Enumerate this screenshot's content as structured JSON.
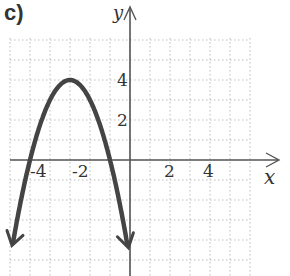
{
  "panel_label": "c)",
  "chart_data": {
    "type": "line",
    "title": "",
    "xlabel": "x",
    "ylabel": "y",
    "function": "y = -(x + 3)^2 + 4",
    "vertex": [
      -3,
      4
    ],
    "x_intercepts": [
      -5,
      -1
    ],
    "x": [
      -6.2,
      -6,
      -5,
      -4,
      -3,
      -2,
      -1,
      0,
      0.2
    ],
    "values": [
      -6.24,
      -5,
      0,
      3,
      4,
      3,
      0,
      -5,
      -6.24
    ],
    "xlim": [
      -6.5,
      6.5
    ],
    "ylim": [
      -5.8,
      6
    ],
    "x_ticks": [
      "-4",
      "-2",
      "2",
      "4"
    ],
    "y_ticks": [
      "4",
      "2"
    ],
    "grid": true,
    "grid_style": "dotted",
    "arrows_on_ends": true
  },
  "colors": {
    "curve": "#444444",
    "axis": "#555555",
    "grid": "#bbbbbb"
  }
}
